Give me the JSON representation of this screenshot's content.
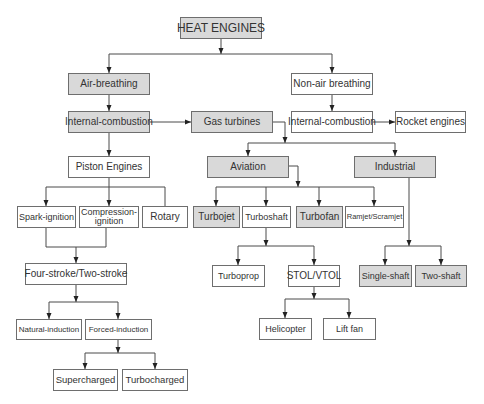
{
  "diagram": {
    "nodes": {
      "heat_engines": {
        "label": "HEAT ENGINES",
        "shaded": true
      },
      "air_breathing": {
        "label": "Air-breathing",
        "shaded": true
      },
      "non_air_breathing": {
        "label": "Non-air breathing",
        "shaded": false
      },
      "ic_left": {
        "label": "Internal-combustion",
        "shaded": true
      },
      "gas_turbines": {
        "label": "Gas turbines",
        "shaded": true
      },
      "ic_right": {
        "label": "Internal-combustion",
        "shaded": false
      },
      "rocket_engines": {
        "label": "Rocket engines",
        "shaded": false
      },
      "piston_engines": {
        "label": "Piston Engines",
        "shaded": false
      },
      "aviation": {
        "label": "Aviation",
        "shaded": true
      },
      "industrial": {
        "label": "Industrial",
        "shaded": true
      },
      "spark_ignition": {
        "label": "Spark-ignition",
        "shaded": false
      },
      "compression_ignition": {
        "label": "Compression-ignition",
        "shaded": false
      },
      "rotary": {
        "label": "Rotary",
        "shaded": false
      },
      "turbojet": {
        "label": "Turbojet",
        "shaded": true
      },
      "turboshaft": {
        "label": "Turboshaft",
        "shaded": false
      },
      "turbofan": {
        "label": "Turbofan",
        "shaded": true
      },
      "ramjet_scramjet": {
        "label": "Ramjet/Scramjet",
        "shaded": false
      },
      "four_two_stroke": {
        "label": "Four-stroke/Two-stroke",
        "shaded": false
      },
      "turboprop": {
        "label": "Turboprop",
        "shaded": false
      },
      "stol_vtol": {
        "label": "STOL/VTOL",
        "shaded": false
      },
      "single_shaft": {
        "label": "Single-shaft",
        "shaded": true
      },
      "two_shaft": {
        "label": "Two-shaft",
        "shaded": true
      },
      "natural_induction": {
        "label": "Natural-induction",
        "shaded": false
      },
      "forced_induction": {
        "label": "Forced-induction",
        "shaded": false
      },
      "helicopter": {
        "label": "Helicopter",
        "shaded": false
      },
      "lift_fan": {
        "label": "Lift fan",
        "shaded": false
      },
      "supercharged": {
        "label": "Supercharged",
        "shaded": false
      },
      "turbocharged": {
        "label": "Turbocharged",
        "shaded": false
      }
    },
    "edges": [
      {
        "from": "heat_engines",
        "to": [
          "air_breathing",
          "non_air_breathing"
        ]
      },
      {
        "from": "air_breathing",
        "to": [
          "ic_left"
        ]
      },
      {
        "from": "non_air_breathing",
        "to": [
          "ic_right"
        ]
      },
      {
        "from": "ic_left",
        "to": [
          "gas_turbines",
          "piston_engines"
        ]
      },
      {
        "from": "ic_right",
        "to": [
          "rocket_engines"
        ]
      },
      {
        "from": "gas_turbines",
        "to": [
          "aviation",
          "industrial"
        ]
      },
      {
        "from": "piston_engines",
        "to": [
          "spark_ignition",
          "compression_ignition",
          "rotary"
        ]
      },
      {
        "from": "aviation",
        "to": [
          "turbojet",
          "turboshaft",
          "turbofan",
          "ramjet_scramjet"
        ]
      },
      {
        "from": "industrial",
        "to": [
          "single_shaft",
          "two_shaft"
        ]
      },
      {
        "from": "spark_ignition",
        "to": [
          "four_two_stroke"
        ]
      },
      {
        "from": "compression_ignition",
        "to": [
          "four_two_stroke"
        ]
      },
      {
        "from": "turboshaft",
        "to": [
          "turboprop",
          "stol_vtol"
        ]
      },
      {
        "from": "four_two_stroke",
        "to": [
          "natural_induction",
          "forced_induction"
        ]
      },
      {
        "from": "stol_vtol",
        "to": [
          "helicopter",
          "lift_fan"
        ]
      },
      {
        "from": "forced_induction",
        "to": [
          "supercharged",
          "turbocharged"
        ]
      }
    ]
  }
}
